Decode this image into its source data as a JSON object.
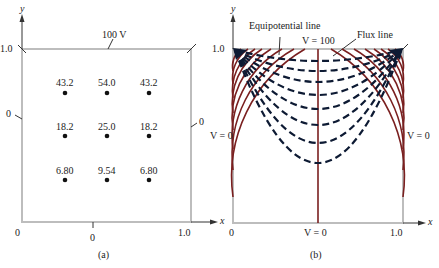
{
  "figure_a": {
    "caption": "(a)",
    "top_label": "100 V",
    "left_label": "0",
    "right_label": "0",
    "bottom_label": "0",
    "origin_label": "0",
    "x_tick": "1.0",
    "y_tick": "1.0",
    "x_axis": "x",
    "y_axis": "y",
    "grid_values": [
      [
        "43.2",
        "54.0",
        "43.2"
      ],
      [
        "18.2",
        "25.0",
        "18.2"
      ],
      [
        "6.80",
        "9.54",
        "6.80"
      ]
    ]
  },
  "figure_b": {
    "caption": "(b)",
    "top_label": "V = 100",
    "left_label": "V = 0",
    "right_label": "V = 0",
    "bottom_label": "V = 0",
    "origin_label": "0",
    "x_tick": "1.0",
    "y_tick": "1.0",
    "x_axis": "x",
    "y_axis": "y",
    "annotation_equipotential": "Equipotential line",
    "annotation_flux": "Flux line",
    "colors": {
      "flux": "#7a1f1f",
      "equipotential": "#0d1a33",
      "frame": "#bdbdbd"
    }
  }
}
